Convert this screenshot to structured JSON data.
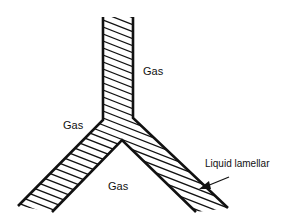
{
  "diagram": {
    "labels": {
      "gas_top_right": "Gas",
      "gas_left": "Gas",
      "gas_bottom": "Gas",
      "lamella": "Liquid lamellar"
    },
    "colors": {
      "stroke": "#111111",
      "background": "#ffffff"
    }
  }
}
